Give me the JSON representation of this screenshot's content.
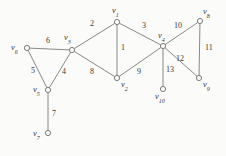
{
  "figure": {
    "kind": "undirected-graph-diagram",
    "background_color": "#fbfbf9",
    "line_color": "#7a7a78",
    "label_color": "#3a3a38",
    "width": 226,
    "height": 156
  },
  "vertices": [
    {
      "id": "v1",
      "label": "v",
      "sub": "1",
      "x": 117,
      "y": 22,
      "label_x": 112,
      "label_y": 6,
      "label_anchor": "left"
    },
    {
      "id": "v2",
      "label": "v",
      "sub": "2",
      "x": 117,
      "y": 78,
      "label_x": 121,
      "label_y": 80,
      "label_anchor": "left"
    },
    {
      "id": "v3",
      "label": "v",
      "sub": "3",
      "x": 72,
      "y": 50,
      "label_x": 64,
      "label_y": 33,
      "label_anchor": "left"
    },
    {
      "id": "v4",
      "label": "v",
      "sub": "4",
      "x": 163,
      "y": 46,
      "label_x": 158,
      "label_y": 31,
      "label_anchor": "left"
    },
    {
      "id": "v5",
      "label": "v",
      "sub": "5",
      "x": 48,
      "y": 90,
      "label_x": 33,
      "label_y": 85,
      "label_anchor": "left"
    },
    {
      "id": "v6",
      "label": "v",
      "sub": "6",
      "x": 27,
      "y": 48,
      "label_x": 11,
      "label_y": 43,
      "label_anchor": "left"
    },
    {
      "id": "v7",
      "label": "v",
      "sub": "7",
      "x": 48,
      "y": 133,
      "label_x": 33,
      "label_y": 129,
      "label_anchor": "left"
    },
    {
      "id": "v8",
      "label": "v",
      "sub": "8",
      "x": 200,
      "y": 21,
      "label_x": 203,
      "label_y": 7,
      "label_anchor": "left"
    },
    {
      "id": "v9",
      "label": "v",
      "sub": "9",
      "x": 199,
      "y": 78,
      "label_x": 203,
      "label_y": 80,
      "label_anchor": "left"
    },
    {
      "id": "v10",
      "label": "v",
      "sub": "10",
      "x": 163,
      "y": 89,
      "label_x": 155,
      "label_y": 92,
      "label_anchor": "left"
    }
  ],
  "edges": [
    {
      "id": "e1",
      "label": "1",
      "from": "v1",
      "to": "v2",
      "label_x": 121,
      "label_y": 44
    },
    {
      "id": "e2",
      "label": "2",
      "from": "v3",
      "to": "v1",
      "label_x": 90,
      "label_y": 20
    },
    {
      "id": "e3",
      "label": "3",
      "from": "v1",
      "to": "v4",
      "label_x": 142,
      "label_y": 22
    },
    {
      "id": "e4",
      "label": "4",
      "from": "v3",
      "to": "v5",
      "label_x": 62,
      "label_y": 68
    },
    {
      "id": "e5",
      "label": "5",
      "from": "v6",
      "to": "v5",
      "label_x": 31,
      "label_y": 67
    },
    {
      "id": "e6",
      "label": "6",
      "from": "v6",
      "to": "v3",
      "label_x": 46,
      "label_y": 37
    },
    {
      "id": "e7",
      "label": "7",
      "from": "v5",
      "to": "v7",
      "label_x": 52,
      "label_y": 110
    },
    {
      "id": "e8",
      "label": "8",
      "from": "v3",
      "to": "v2",
      "label_x": 90,
      "label_y": 68
    },
    {
      "id": "e9",
      "label": "9",
      "from": "v2",
      "to": "v4",
      "label_x": 137,
      "label_y": 68
    },
    {
      "id": "e10",
      "label": "10",
      "from": "v4",
      "to": "v8",
      "label_x": 174,
      "label_y": 22
    },
    {
      "id": "e11",
      "label": "11",
      "from": "v8",
      "to": "v9",
      "label_x": 205,
      "label_y": 44
    },
    {
      "id": "e12",
      "label": "12",
      "from": "v4",
      "to": "v9",
      "label_x": 176,
      "label_y": 55
    },
    {
      "id": "e13",
      "label": "13",
      "from": "v4",
      "to": "v10",
      "label_x": 166,
      "label_y": 66
    }
  ]
}
